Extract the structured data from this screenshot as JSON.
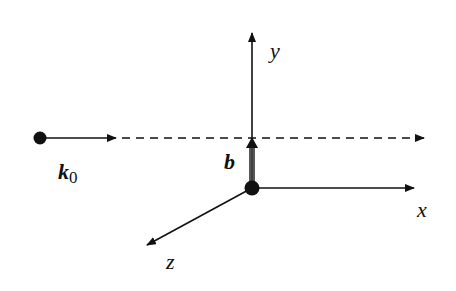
{
  "diagram": {
    "labels": {
      "y_axis": "y",
      "x_axis": "x",
      "z_axis": "z",
      "impact_parameter": "b",
      "wave_vector": "k",
      "wave_vector_subscript": "0"
    },
    "colors": {
      "line": "#111111",
      "background": "#ffffff"
    }
  }
}
